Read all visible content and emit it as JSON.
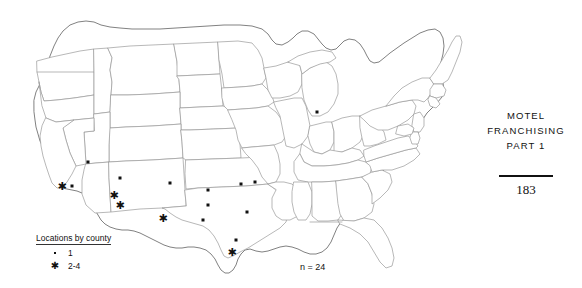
{
  "figure": {
    "title_alt": "United States county map of motel franchise locations",
    "sample_size_label": "n = 24",
    "legend": {
      "title": "Locations by county",
      "entries": [
        {
          "symbol": "dot",
          "label": "1"
        },
        {
          "symbol": "star",
          "label": "2-4"
        }
      ]
    },
    "markers": [
      {
        "type": "star",
        "x": 62,
        "y": 186
      },
      {
        "type": "dot",
        "x": 72,
        "y": 186
      },
      {
        "type": "dot",
        "x": 88,
        "y": 162
      },
      {
        "type": "star",
        "x": 114,
        "y": 195
      },
      {
        "type": "star",
        "x": 120,
        "y": 205
      },
      {
        "type": "dot",
        "x": 120,
        "y": 178
      },
      {
        "type": "dot",
        "x": 170,
        "y": 183
      },
      {
        "type": "star",
        "x": 163,
        "y": 218
      },
      {
        "type": "dot",
        "x": 208,
        "y": 190
      },
      {
        "type": "dot",
        "x": 208,
        "y": 205
      },
      {
        "type": "dot",
        "x": 203,
        "y": 220
      },
      {
        "type": "dot",
        "x": 241,
        "y": 184
      },
      {
        "type": "dot",
        "x": 255,
        "y": 182
      },
      {
        "type": "dot",
        "x": 247,
        "y": 212
      },
      {
        "type": "dot",
        "x": 236,
        "y": 240
      },
      {
        "type": "star",
        "x": 232,
        "y": 252
      },
      {
        "type": "dot",
        "x": 317,
        "y": 112
      }
    ]
  },
  "running_head": {
    "line1": "MOTEL",
    "line2": "FRANCHISING",
    "line3": "PART 1",
    "page_number": "183"
  },
  "colors": {
    "ink": "#111111",
    "state_border": "#9a9a9a",
    "outline": "#6a6a6a",
    "background": "#ffffff"
  }
}
